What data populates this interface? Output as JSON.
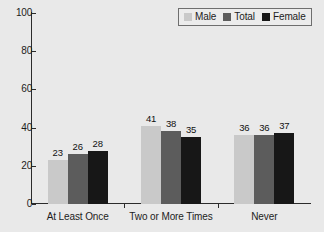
{
  "chart_data": {
    "type": "bar",
    "title": "",
    "subtitle": "",
    "xlabel": "",
    "ylabel": "",
    "categories": [
      "At Least Once",
      "Two or More Times",
      "Never"
    ],
    "series": [
      {
        "name": "Male",
        "color": "#c9c9c9",
        "values": [
          23,
          41,
          36
        ]
      },
      {
        "name": "Total",
        "color": "#5c5c5c",
        "values": [
          26,
          38,
          36
        ]
      },
      {
        "name": "Female",
        "color": "#171717",
        "values": [
          28,
          35,
          37
        ]
      }
    ],
    "ylim": [
      0,
      100
    ],
    "yticks": [
      0,
      20,
      40,
      60,
      80,
      100
    ],
    "ytick_labels": [
      "0",
      "20",
      "40",
      "60",
      "80",
      "100"
    ],
    "grid": false,
    "legend_position": "top-right",
    "data_labels": true,
    "bar_grouping": "grouped-adjacent",
    "background_color": "#e9e9e9",
    "axis_color": "#2b2b2b",
    "text_color": "#1c1c1c"
  },
  "legend": {
    "entries": [
      {
        "label": "Male"
      },
      {
        "label": "Total"
      },
      {
        "label": "Female"
      }
    ]
  }
}
